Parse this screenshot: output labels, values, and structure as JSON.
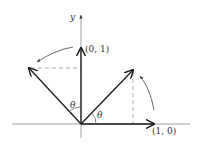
{
  "diagram": {
    "axis_labels": {
      "y": "y"
    },
    "vector_labels": {
      "e2": "(0, 1)",
      "e1": "(1, 0)"
    },
    "angle_labels": {
      "left": "θ",
      "right": "θ"
    },
    "colors": {
      "line": "#1a1a1a",
      "axis": "#888888",
      "dashed": "#9a9a9a"
    }
  }
}
